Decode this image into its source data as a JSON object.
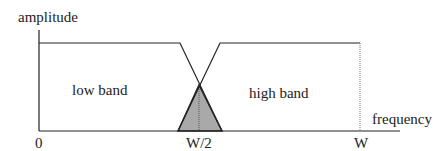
{
  "diagram": {
    "y_axis_label": "amplitude",
    "x_axis_label": "frequency",
    "regions": [
      {
        "label": "low band"
      },
      {
        "label": "high band"
      }
    ],
    "ticks": {
      "zero": "0",
      "half": "W/2",
      "full": "W"
    },
    "colors": {
      "line": "#222222",
      "overlap_fill": "#a9a9a9"
    }
  }
}
